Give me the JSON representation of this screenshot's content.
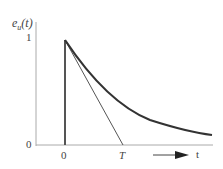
{
  "diagram": {
    "y_label": "e_u(t)",
    "y_label_main": "e",
    "y_label_sub": "u",
    "y_label_arg": "(t)",
    "y_tick": "1",
    "origin_label": "0",
    "x_tick_zero": "0",
    "x_tick_T": "T",
    "x_axis_label": "t",
    "curve": "exponential decay starting at 1 at t=0",
    "tangent": "tangent line from peak intersecting axis at T"
  }
}
